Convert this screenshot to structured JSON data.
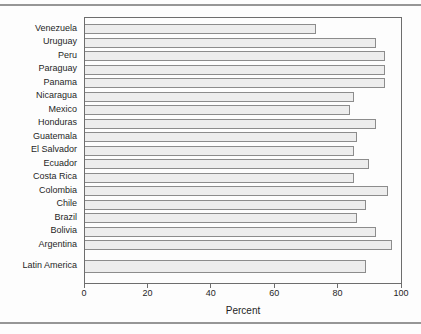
{
  "figure": {
    "x_ticks": [
      0,
      20,
      40,
      60,
      80,
      100
    ],
    "x_axis_title": "Percent"
  },
  "chart_data": {
    "type": "bar",
    "orientation": "horizontal",
    "title": "",
    "xlabel": "Percent",
    "ylabel": "",
    "xlim": [
      0,
      100
    ],
    "grid": false,
    "legend": "none",
    "categories": [
      "Venezuela",
      "Uruguay",
      "Peru",
      "Paraguay",
      "Panama",
      "Nicaragua",
      "Mexico",
      "Honduras",
      "Guatemala",
      "El Salvador",
      "Ecuador",
      "Costa Rica",
      "Colombia",
      "Chile",
      "Brazil",
      "Bolivia",
      "Argentina",
      "Latin America"
    ],
    "values": [
      73,
      92,
      95,
      95,
      95,
      85,
      84,
      92,
      86,
      85,
      90,
      85,
      96,
      89,
      86,
      92,
      97,
      89
    ],
    "summary_category": "Latin America"
  },
  "colors": {
    "bar_fill": "#ededed",
    "bar_border": "#8c8c8c",
    "frame": "#6d6d6d",
    "rule": "#969696",
    "text": "#1f1f1f",
    "background": "#fdfdfd"
  }
}
